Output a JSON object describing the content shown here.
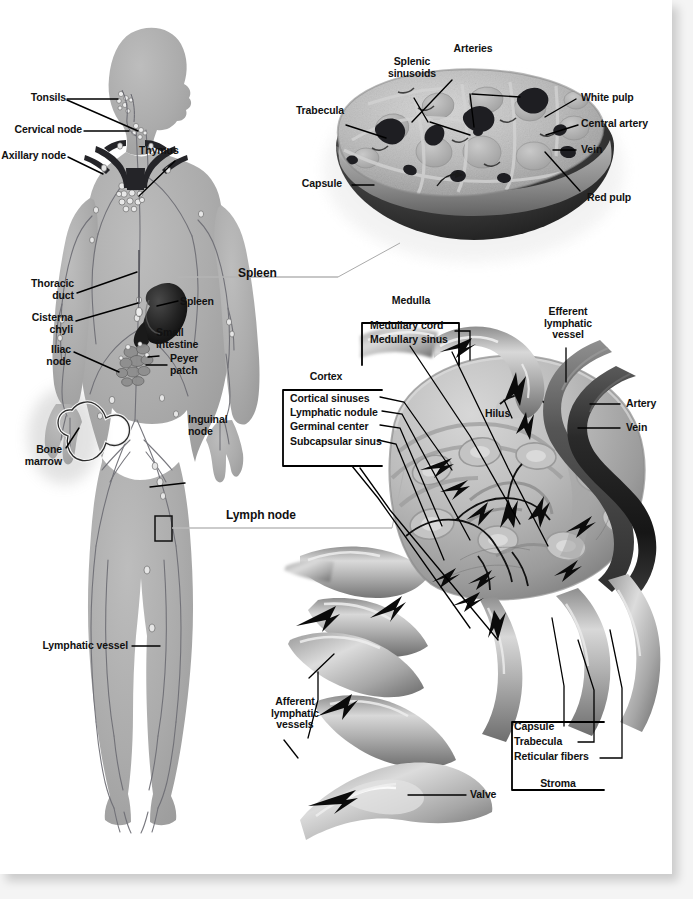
{
  "figure": {
    "title_hidden": "",
    "sections": {
      "body": "Lymphatic system of the human body",
      "spleen": "Spleen",
      "lymph_node": "Lymph node"
    }
  },
  "section_labels": {
    "spleen": "Spleen",
    "lymph_node": "Lymph node"
  },
  "body_labels": [
    {
      "id": "tonsils",
      "text": "Tonsils"
    },
    {
      "id": "cervical-node",
      "text": "Cervical node"
    },
    {
      "id": "axillary-node",
      "text": "Axillary node"
    },
    {
      "id": "thymus",
      "text": "Thymus"
    },
    {
      "id": "thoracic-duct",
      "text": "Thoracic\nduct"
    },
    {
      "id": "spleen-organ",
      "text": "Spleen"
    },
    {
      "id": "cisterna-chyli",
      "text": "Cisterna\nchyli"
    },
    {
      "id": "small-intestine",
      "text": "Small\nintestine"
    },
    {
      "id": "iliac-node",
      "text": "Iliac\nnode"
    },
    {
      "id": "peyer-patch",
      "text": "Peyer\npatch"
    },
    {
      "id": "bone-marrow",
      "text": "Bone\nmarrow"
    },
    {
      "id": "inguinal-node",
      "text": "Inguinal\nnode"
    },
    {
      "id": "lymphatic-vessel",
      "text": "Lymphatic vessel"
    }
  ],
  "spleen_labels": [
    {
      "id": "splenic-sinusoids",
      "text": "Splenic\nsinusoids"
    },
    {
      "id": "arteries",
      "text": "Arteries"
    },
    {
      "id": "white-pulp",
      "text": "White pulp"
    },
    {
      "id": "trabecula",
      "text": "Trabecula"
    },
    {
      "id": "central-artery",
      "text": "Central artery"
    },
    {
      "id": "vein",
      "text": "Vein"
    },
    {
      "id": "capsule",
      "text": "Capsule"
    },
    {
      "id": "red-pulp",
      "text": "Red pulp"
    }
  ],
  "lymph_node_labels": [
    {
      "id": "medulla",
      "text": "Medulla"
    },
    {
      "id": "medullary-cord",
      "text": "Medullary cord"
    },
    {
      "id": "medullary-sinus",
      "text": "Medullary sinus"
    },
    {
      "id": "cortex",
      "text": "Cortex"
    },
    {
      "id": "cortical-sinuses",
      "text": "Cortical sinuses"
    },
    {
      "id": "lymphatic-nodule",
      "text": "Lymphatic nodule"
    },
    {
      "id": "germinal-center",
      "text": "Germinal center"
    },
    {
      "id": "subcapsular-sinus",
      "text": "Subcapsular sinus"
    },
    {
      "id": "efferent-vessel",
      "text": "Efferent\nlymphatic\nvessel"
    },
    {
      "id": "hilus",
      "text": "Hilus"
    },
    {
      "id": "artery",
      "text": "Artery"
    },
    {
      "id": "vein",
      "text": "Vein"
    },
    {
      "id": "afferent-vessels",
      "text": "Afferent\nlymphatic\nvessels"
    },
    {
      "id": "valve",
      "text": "Valve"
    },
    {
      "id": "capsule",
      "text": "Capsule"
    },
    {
      "id": "trabecula",
      "text": "Trabecula"
    },
    {
      "id": "reticular-fibers",
      "text": "Reticular fibers"
    },
    {
      "id": "stroma",
      "text": "Stroma"
    }
  ],
  "colors": {
    "page_background": "#f2f2f2",
    "sheet": "#ffffff",
    "body_silhouette": "#a8a8a8",
    "body_silhouette_edge": "#9a9a9a",
    "vessel": "#6d6d74",
    "organ_dark": "#2b2b2b",
    "spleen_outer": "#3a3a3a",
    "spleen_cut": "#b4b4b4",
    "node_body": "#b6b6b6",
    "node_shadow": "#7a7a7a",
    "label_text": "#111111",
    "leader_line": "#000000"
  }
}
